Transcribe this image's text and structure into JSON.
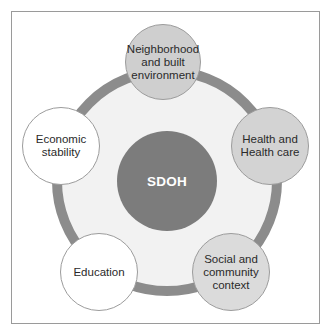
{
  "diagram": {
    "type": "hub-and-spoke",
    "colors": {
      "frame_border": "#9a9a9a",
      "ring": "#8c8c8c",
      "ring_fill": "#f2f2f2",
      "hub_fill": "#7c7c7c",
      "hub_text": "#ffffff",
      "node_text": "#2a2a2a"
    },
    "hub": {
      "label": "SDOH",
      "cx": 167,
      "cy": 181,
      "r": 50
    },
    "ring": {
      "cx": 167,
      "cy": 181,
      "r": 115,
      "thickness": 10
    },
    "nodes": [
      {
        "id": "neighborhood",
        "label": "Neighborhood\nand built\nenvironment",
        "cx": 163,
        "cy": 62,
        "r": 38,
        "fill": "#cfcfcf"
      },
      {
        "id": "health",
        "label": "Health and\nHealth care",
        "cx": 270,
        "cy": 146,
        "r": 39,
        "fill": "#d3d3d3"
      },
      {
        "id": "social",
        "label": "Social and\ncommunity\ncontext",
        "cx": 231,
        "cy": 272,
        "r": 39,
        "fill": "#dbdbdb"
      },
      {
        "id": "education",
        "label": "Education",
        "cx": 99,
        "cy": 272,
        "r": 39,
        "fill": "#ffffff"
      },
      {
        "id": "economic",
        "label": "Economic\nstability",
        "cx": 61,
        "cy": 146,
        "r": 39,
        "fill": "#ffffff"
      }
    ]
  }
}
